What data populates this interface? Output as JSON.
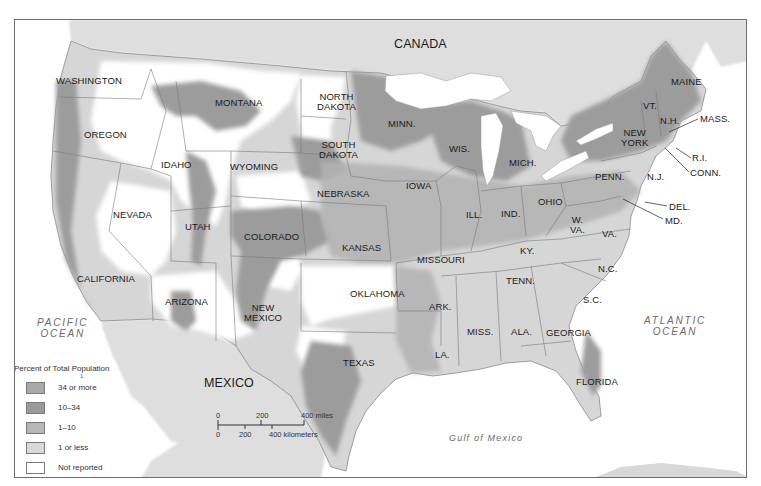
{
  "map": {
    "countries": [
      {
        "name": "CANADA",
        "x": 393,
        "y": 41
      },
      {
        "name": "MEXICO",
        "x": 203,
        "y": 379
      }
    ],
    "oceans": [
      {
        "name": "PACIFIC\nOCEAN",
        "line1": "PACIFIC",
        "line2": "OCEAN",
        "x": 36,
        "y": 316
      },
      {
        "name": "ATLANTIC\nOCEAN",
        "line1": "ATLANTIC",
        "line2": "OCEAN",
        "x": 645,
        "y": 315
      }
    ],
    "gulf": {
      "name": "Gulf of Mexico",
      "x": 448,
      "y": 431
    },
    "states": [
      {
        "id": "washington",
        "label": "WASHINGTON",
        "x": 55,
        "y": 75
      },
      {
        "id": "oregon",
        "label": "OREGON",
        "x": 83,
        "y": 129
      },
      {
        "id": "idaho",
        "label": "IDAHO",
        "x": 160,
        "y": 159
      },
      {
        "id": "montana",
        "label": "MONTANA",
        "x": 214,
        "y": 97
      },
      {
        "id": "wyoming",
        "label": "WYOMING",
        "x": 229,
        "y": 160
      },
      {
        "id": "north-dakota",
        "label": "NORTH\nDAKOTA",
        "line1": "NORTH",
        "line2": "DAKOTA",
        "x": 316,
        "y": 91
      },
      {
        "id": "south-dakota",
        "label": "SOUTH\nDAKOTA",
        "line1": "SOUTH",
        "line2": "DAKOTA",
        "x": 316,
        "y": 138
      },
      {
        "id": "nebraska",
        "label": "NEBRASKA",
        "x": 316,
        "y": 188
      },
      {
        "id": "nevada",
        "label": "NEVADA",
        "x": 112,
        "y": 209
      },
      {
        "id": "utah",
        "label": "UTAH",
        "x": 184,
        "y": 220
      },
      {
        "id": "colorado",
        "label": "COLORADO",
        "x": 243,
        "y": 231
      },
      {
        "id": "kansas",
        "label": "KANSAS",
        "x": 341,
        "y": 242
      },
      {
        "id": "california",
        "label": "CALIFORNIA",
        "x": 76,
        "y": 273
      },
      {
        "id": "arizona",
        "label": "ARIZONA",
        "x": 164,
        "y": 295
      },
      {
        "id": "new-mexico",
        "label": "NEW\nMEXICO",
        "line1": "NEW",
        "line2": "MEXICO",
        "x": 243,
        "y": 302
      },
      {
        "id": "oklahoma",
        "label": "OKLAHOMA",
        "x": 349,
        "y": 288
      },
      {
        "id": "texas",
        "label": "TEXAS",
        "x": 342,
        "y": 357
      },
      {
        "id": "minnesota",
        "label": "MINN.",
        "x": 387,
        "y": 118
      },
      {
        "id": "wisconsin",
        "label": "WIS.",
        "x": 448,
        "y": 143
      },
      {
        "id": "iowa",
        "label": "IOWA",
        "x": 405,
        "y": 180
      },
      {
        "id": "illinois",
        "label": "ILL.",
        "x": 465,
        "y": 208
      },
      {
        "id": "missouri",
        "label": "MISSOURI",
        "x": 416,
        "y": 254
      },
      {
        "id": "arkansas",
        "label": "ARK.",
        "x": 428,
        "y": 300
      },
      {
        "id": "louisiana",
        "label": "LA.",
        "x": 434,
        "y": 348
      },
      {
        "id": "michigan",
        "label": "MICH.",
        "x": 508,
        "y": 157
      },
      {
        "id": "indiana",
        "label": "IND.",
        "x": 500,
        "y": 208
      },
      {
        "id": "ohio",
        "label": "OHIO",
        "x": 537,
        "y": 196
      },
      {
        "id": "kentucky",
        "label": "KY.",
        "x": 519,
        "y": 245
      },
      {
        "id": "tennessee",
        "label": "TENN.",
        "x": 505,
        "y": 275
      },
      {
        "id": "mississippi",
        "label": "MISS.",
        "x": 466,
        "y": 325
      },
      {
        "id": "alabama",
        "label": "ALA.",
        "x": 510,
        "y": 326
      },
      {
        "id": "georgia",
        "label": "GEORGIA",
        "x": 545,
        "y": 327
      },
      {
        "id": "florida",
        "label": "FLORIDA",
        "x": 575,
        "y": 376
      },
      {
        "id": "west-virginia",
        "label": "W.\nVA.",
        "line1": "W.",
        "line2": "VA.",
        "x": 569,
        "y": 214
      },
      {
        "id": "virginia",
        "label": "VA.",
        "x": 601,
        "y": 228
      },
      {
        "id": "north-carolina",
        "label": "N.C.",
        "x": 597,
        "y": 263
      },
      {
        "id": "south-carolina",
        "label": "S.C.",
        "x": 582,
        "y": 294
      },
      {
        "id": "pennsylvania",
        "label": "PENN.",
        "x": 594,
        "y": 171
      },
      {
        "id": "new-york",
        "label": "NEW\nYORK",
        "line1": "NEW",
        "line2": "YORK",
        "x": 617,
        "y": 127
      },
      {
        "id": "new-jersey",
        "label": "N.J.",
        "x": 646,
        "y": 171
      },
      {
        "id": "vermont",
        "label": "VT.",
        "x": 642,
        "y": 100
      },
      {
        "id": "new-hampshire",
        "label": "N.H.",
        "x": 659,
        "y": 115
      },
      {
        "id": "maine",
        "label": "MAINE",
        "x": 670,
        "y": 76
      },
      {
        "id": "massachusetts",
        "label": "MASS.",
        "x": 699,
        "y": 113
      },
      {
        "id": "rhode-island",
        "label": "R.I.",
        "x": 691,
        "y": 152
      },
      {
        "id": "connecticut",
        "label": "CONN.",
        "x": 689,
        "y": 167
      },
      {
        "id": "delaware",
        "label": "DEL.",
        "x": 668,
        "y": 201
      },
      {
        "id": "maryland",
        "label": "MD.",
        "x": 664,
        "y": 216
      }
    ],
    "leader_lines": [
      {
        "state": "massachusetts",
        "x1": 697,
        "y1": 118,
        "x2": 668,
        "y2": 131
      },
      {
        "state": "rhode-island",
        "x1": 690,
        "y1": 157,
        "x2": 675,
        "y2": 147
      },
      {
        "state": "connecticut",
        "x1": 688,
        "y1": 171,
        "x2": 664,
        "y2": 147
      },
      {
        "state": "delaware",
        "x1": 666,
        "y1": 205,
        "x2": 644,
        "y2": 201
      },
      {
        "state": "maryland",
        "x1": 662,
        "y1": 218,
        "x2": 622,
        "y2": 198
      }
    ]
  },
  "legend": {
    "title": "Percent of Total Population",
    "footnote_mark": "1",
    "items": [
      {
        "label": "34 or more",
        "color": "#a9a9a9"
      },
      {
        "label": "10–34",
        "color": "#9a9a9a"
      },
      {
        "label": "1–10",
        "color": "#b7b7b7"
      },
      {
        "label": "1 or less",
        "color": "#d9d9d9"
      },
      {
        "label": "Not reported",
        "color": "#ffffff"
      }
    ]
  },
  "scale_bar": {
    "miles_ticks": [
      "0",
      "200",
      "400 miles"
    ],
    "km_ticks": [
      "0",
      "200",
      "400 kilometers"
    ]
  },
  "colors": {
    "frame": "#6e6e6e",
    "water": "#ffffff",
    "foreign_land": "#dcdcdc",
    "tier_high": "#9c9c9c",
    "tier_mid": "#a8a8a8",
    "tier_low": "#c4c4c4",
    "tier_min": "#d8d8d8",
    "not_reported": "#ffffff",
    "border": "#7a7a7a"
  }
}
